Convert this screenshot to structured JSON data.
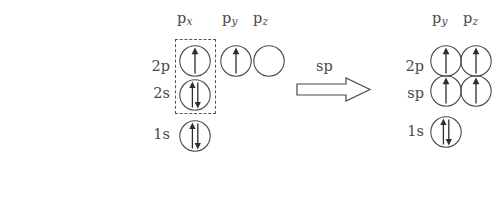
{
  "figure": {
    "background_color": "#ffffff",
    "stroke_color": "#4a4a4a",
    "text_color": "#4a4a4a"
  },
  "left_panel": {
    "column_headers": [
      {
        "base": "p",
        "sub": "x"
      },
      {
        "base": "p",
        "sub": "y"
      },
      {
        "base": "p",
        "sub": "z"
      }
    ],
    "rows": [
      {
        "label": "2p",
        "orbitals": [
          "up",
          "up",
          "empty"
        ]
      },
      {
        "label": "2s",
        "orbitals": [
          "up-down"
        ]
      },
      {
        "label": "1s",
        "orbitals": [
          "up-down"
        ]
      }
    ],
    "highlight_box": {
      "encloses": "2p px and 2s orbitals",
      "style": "dashed"
    }
  },
  "transform": {
    "label": "sp",
    "arrow": "right-arrow"
  },
  "right_panel": {
    "column_headers": [
      {
        "base": "p",
        "sub": "y"
      },
      {
        "base": "p",
        "sub": "z"
      }
    ],
    "rows": [
      {
        "label": "2p",
        "orbitals": [
          "up",
          "up"
        ]
      },
      {
        "label": "sp",
        "orbitals": [
          "up",
          "up"
        ]
      },
      {
        "label": "1s",
        "orbitals": [
          "up-down"
        ]
      }
    ]
  }
}
